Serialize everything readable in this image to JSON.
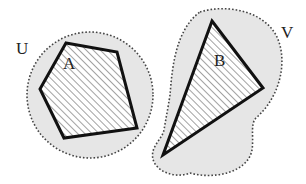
{
  "diagram": {
    "type": "set-neighborhood-illustration",
    "colors": {
      "background": "#ffffff",
      "region_fill": "#e6e6e6",
      "region_outline": "#444444",
      "polygon_stroke": "#111111",
      "hatch": "#555555"
    },
    "regions": [
      {
        "id": "U",
        "label": "U",
        "shape": "circle",
        "outline": "dotted"
      },
      {
        "id": "V",
        "label": "V",
        "shape": "blob",
        "outline": "dotted"
      }
    ],
    "sets": [
      {
        "id": "A",
        "label": "A",
        "shape": "pentagon",
        "fill": "hatched",
        "inside": "U"
      },
      {
        "id": "B",
        "label": "B",
        "shape": "triangle",
        "fill": "hatched",
        "inside": "V"
      }
    ]
  }
}
